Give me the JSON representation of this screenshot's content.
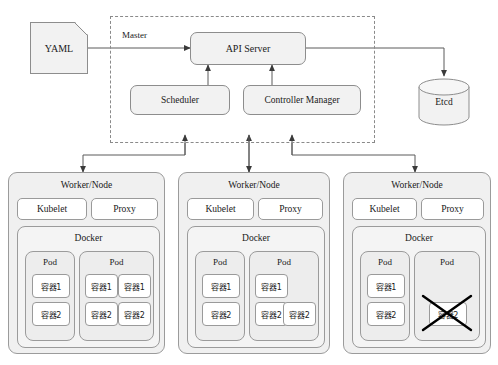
{
  "diagram": {
    "colors": {
      "box_fill": "#f2f2f2",
      "box_stroke": "#8d8d8d",
      "node_fill": "#f0f0f0",
      "container_fill": "#ffffff",
      "line": "#5a5a5a",
      "cross_mark": "#000000",
      "background": "#ffffff"
    }
  },
  "source": {
    "yaml_label": "YAML"
  },
  "master": {
    "label": "Master",
    "api_server": "API Server",
    "scheduler": "Scheduler",
    "controller_manager": "Controller Manager"
  },
  "storage": {
    "etcd_label": "Etcd"
  },
  "node_labels": {
    "node_title": "Worker/Node",
    "kubelet": "Kubelet",
    "proxy": "Proxy",
    "docker": "Docker",
    "pod": "Pod"
  },
  "nodes": [
    {
      "id": "node-1",
      "title": "Worker/Node",
      "kubelet": "Kubelet",
      "proxy": "Proxy",
      "docker": "Docker",
      "pods": [
        {
          "title": "Pod",
          "columns": 1,
          "containers": [
            {
              "label": "容器1",
              "crossed": false
            },
            {
              "label": "容器2",
              "crossed": false
            }
          ]
        },
        {
          "title": "Pod",
          "columns": 2,
          "containers": [
            {
              "label": "容器1",
              "crossed": false
            },
            {
              "label": "容器1",
              "crossed": false
            },
            {
              "label": "容器2",
              "crossed": false
            },
            {
              "label": "容器2",
              "crossed": false
            }
          ]
        }
      ]
    },
    {
      "id": "node-2",
      "title": "Worker/Node",
      "kubelet": "Kubelet",
      "proxy": "Proxy",
      "docker": "Docker",
      "pods": [
        {
          "title": "Pod",
          "columns": 1,
          "containers": [
            {
              "label": "容器1",
              "crossed": false
            },
            {
              "label": "容器2",
              "crossed": false
            }
          ]
        },
        {
          "title": "Pod",
          "columns": 2,
          "containers": [
            {
              "label": "容器1",
              "crossed": false
            },
            {
              "label": "",
              "crossed": false
            },
            {
              "label": "容器2",
              "crossed": false
            },
            {
              "label": "容器2",
              "crossed": false
            }
          ]
        }
      ]
    },
    {
      "id": "node-3",
      "title": "Worker/Node",
      "kubelet": "Kubelet",
      "proxy": "Proxy",
      "docker": "Docker",
      "pods": [
        {
          "title": "Pod",
          "columns": 1,
          "containers": [
            {
              "label": "容器1",
              "crossed": false
            },
            {
              "label": "容器2",
              "crossed": false
            }
          ]
        },
        {
          "title": "Pod",
          "columns": 1,
          "containers": [
            {
              "label": "",
              "crossed": false
            },
            {
              "label": "容器2",
              "crossed": true
            }
          ]
        }
      ]
    }
  ],
  "connections": [
    {
      "from": "YAML",
      "to": "API Server",
      "style": "arrow"
    },
    {
      "from": "API Server",
      "to": "Etcd",
      "style": "arrow"
    },
    {
      "from": "Scheduler",
      "to": "API Server",
      "style": "arrow"
    },
    {
      "from": "Controller Manager",
      "to": "API Server",
      "style": "arrow"
    },
    {
      "from": "Worker/Node 1",
      "to": "Master",
      "style": "double-arrow"
    },
    {
      "from": "Worker/Node 2",
      "to": "Master",
      "style": "double-arrow"
    },
    {
      "from": "Worker/Node 3",
      "to": "Master",
      "style": "double-arrow"
    }
  ]
}
